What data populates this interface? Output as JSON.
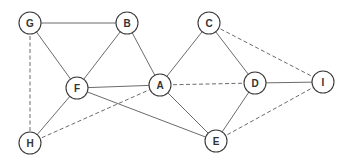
{
  "graph": {
    "node_radius": 11,
    "nodes": [
      {
        "id": "G",
        "label": "G",
        "x": 30,
        "y": 23
      },
      {
        "id": "B",
        "label": "B",
        "x": 127,
        "y": 23
      },
      {
        "id": "C",
        "label": "C",
        "x": 209,
        "y": 23
      },
      {
        "id": "F",
        "label": "F",
        "x": 77,
        "y": 88
      },
      {
        "id": "A",
        "label": "A",
        "x": 160,
        "y": 85
      },
      {
        "id": "D",
        "label": "D",
        "x": 255,
        "y": 83
      },
      {
        "id": "I",
        "label": "I",
        "x": 323,
        "y": 82
      },
      {
        "id": "H",
        "label": "H",
        "x": 30,
        "y": 143
      },
      {
        "id": "E",
        "label": "E",
        "x": 216,
        "y": 141
      }
    ],
    "edges": [
      {
        "from": "G",
        "to": "B",
        "style": "solid"
      },
      {
        "from": "G",
        "to": "F",
        "style": "solid"
      },
      {
        "from": "B",
        "to": "F",
        "style": "solid"
      },
      {
        "from": "B",
        "to": "A",
        "style": "solid"
      },
      {
        "from": "C",
        "to": "A",
        "style": "solid"
      },
      {
        "from": "C",
        "to": "D",
        "style": "solid"
      },
      {
        "from": "F",
        "to": "A",
        "style": "solid"
      },
      {
        "from": "F",
        "to": "E",
        "style": "solid"
      },
      {
        "from": "A",
        "to": "E",
        "style": "solid"
      },
      {
        "from": "D",
        "to": "E",
        "style": "solid"
      },
      {
        "from": "D",
        "to": "I",
        "style": "solid"
      },
      {
        "from": "F",
        "to": "H",
        "style": "solid"
      },
      {
        "from": "G",
        "to": "H",
        "style": "dashed"
      },
      {
        "from": "C",
        "to": "I",
        "style": "dashed"
      },
      {
        "from": "A",
        "to": "D",
        "style": "dashed"
      },
      {
        "from": "H",
        "to": "A",
        "style": "dashed"
      },
      {
        "from": "E",
        "to": "I",
        "style": "dashed"
      }
    ]
  },
  "colors": {
    "edge": "#6b6b6b",
    "node_stroke": "#3a3a3a",
    "node_fill": "#ffffff",
    "label": "#333333"
  }
}
